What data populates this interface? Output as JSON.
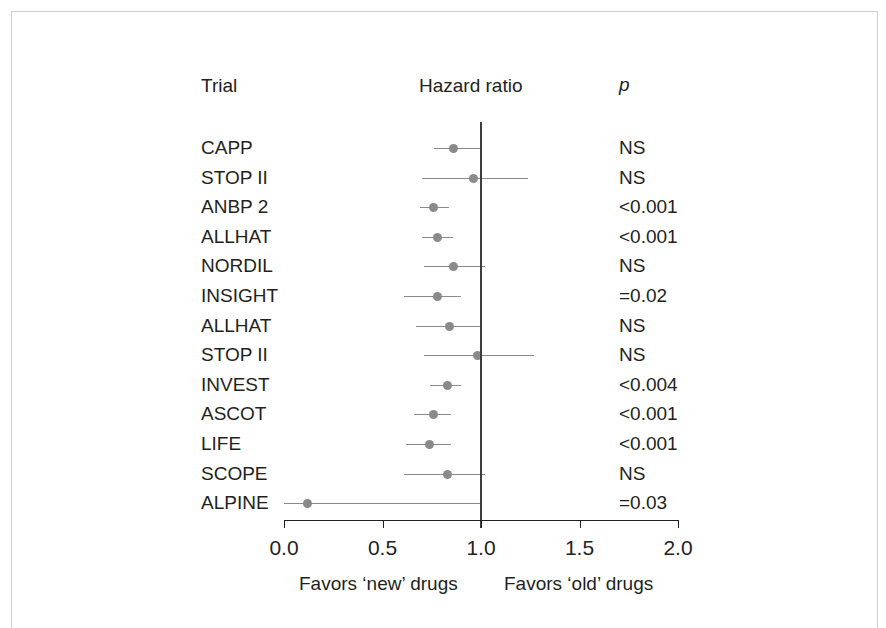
{
  "figure": {
    "columns": {
      "trial_header": "Trial",
      "hazard_header": "Hazard ratio",
      "p_header": "p"
    },
    "footer": {
      "favors_left": "Favors ‘new’ drugs",
      "favors_right": "Favors ‘old’ drugs"
    },
    "colors": {
      "marker": "#8a8a8a",
      "reference_line": "#3d3d3d",
      "axis": "#231f20",
      "text": "#231f20",
      "frame_border": "#cfcfcf",
      "background": "#ffffff"
    }
  },
  "chart_data": {
    "type": "scatter",
    "subtype": "forest-plot",
    "title": "Hazard ratio",
    "xlabel": "Hazard ratio",
    "ylabel": "Trial",
    "xlim": [
      0.0,
      2.0
    ],
    "xticks": [
      "0.0",
      "0.5",
      "1.0",
      "1.5",
      "2.0"
    ],
    "xtick_values": [
      0.0,
      0.5,
      1.0,
      1.5,
      2.0
    ],
    "reference_value": 1.0,
    "grid": false,
    "legend": false,
    "annotations": [
      "Favors ‘new’ drugs",
      "Favors ‘old’ drugs"
    ],
    "categories": [
      "CAPP",
      "STOP II",
      "ANBP 2",
      "ALLHAT",
      "NORDIL",
      "INSIGHT",
      "ALLHAT",
      "STOP II",
      "INVEST",
      "ASCOT",
      "LIFE",
      "SCOPE",
      "ALPINE"
    ],
    "rows": [
      {
        "trial": "CAPP",
        "hazard_ratio": 0.86,
        "ci_low": 0.76,
        "ci_high": 1.0,
        "p": "NS"
      },
      {
        "trial": "STOP II",
        "hazard_ratio": 0.96,
        "ci_low": 0.7,
        "ci_high": 1.24,
        "p": "NS"
      },
      {
        "trial": "ANBP 2",
        "hazard_ratio": 0.76,
        "ci_low": 0.69,
        "ci_high": 0.84,
        "p": "<0.001"
      },
      {
        "trial": "ALLHAT",
        "hazard_ratio": 0.78,
        "ci_low": 0.7,
        "ci_high": 0.86,
        "p": "<0.001"
      },
      {
        "trial": "NORDIL",
        "hazard_ratio": 0.86,
        "ci_low": 0.71,
        "ci_high": 1.02,
        "p": "NS"
      },
      {
        "trial": "INSIGHT",
        "hazard_ratio": 0.78,
        "ci_low": 0.61,
        "ci_high": 0.9,
        "p": "=0.02"
      },
      {
        "trial": "ALLHAT",
        "hazard_ratio": 0.84,
        "ci_low": 0.67,
        "ci_high": 1.0,
        "p": "NS"
      },
      {
        "trial": "STOP II",
        "hazard_ratio": 0.98,
        "ci_low": 0.71,
        "ci_high": 1.27,
        "p": "NS"
      },
      {
        "trial": "INVEST",
        "hazard_ratio": 0.83,
        "ci_low": 0.74,
        "ci_high": 0.9,
        "p": "<0.004"
      },
      {
        "trial": "ASCOT",
        "hazard_ratio": 0.76,
        "ci_low": 0.66,
        "ci_high": 0.85,
        "p": "<0.001"
      },
      {
        "trial": "LIFE",
        "hazard_ratio": 0.74,
        "ci_low": 0.62,
        "ci_high": 0.85,
        "p": "<0.001"
      },
      {
        "trial": "SCOPE",
        "hazard_ratio": 0.83,
        "ci_low": 0.61,
        "ci_high": 1.02,
        "p": "NS"
      },
      {
        "trial": "ALPINE",
        "hazard_ratio": 0.12,
        "ci_low": 0.0,
        "ci_high": 1.0,
        "p": "=0.03"
      }
    ]
  }
}
